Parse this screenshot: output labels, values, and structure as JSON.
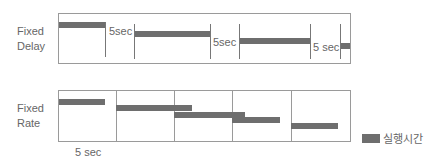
{
  "fixed_delay": {
    "label_line1": "Fixed",
    "label_line2": "Delay",
    "gap_labels": [
      "5sec",
      "5sec",
      "5 sec"
    ]
  },
  "fixed_rate": {
    "label_line1": "Fixed",
    "label_line2": "Rate",
    "interval_label": "5 sec"
  },
  "legend": {
    "label": "실행시간",
    "color": "#6e6e6e"
  }
}
